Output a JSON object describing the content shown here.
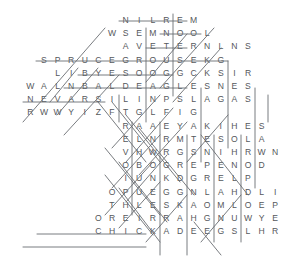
{
  "puzzle": {
    "title": "Word Search Grid",
    "rows": 17,
    "cols": 19,
    "cell_width": 13.6,
    "cell_height": 13.2,
    "origin_x": 10,
    "origin_y": 14,
    "letter_color": "#55585c",
    "mark_color": "#6a6d72",
    "background_color": "#ffffff",
    "grid": [
      "        N I L R E M      ",
      "       W S E M N O O L   ",
      "        A V E T E R N L N S ",
      "  S P R U C E G R O U S E K G ",
      "   L I B Y E S O O G G C K S I R ",
      " W A L N B A L D E A G L E S N E S ",
      " N E V A R S I L I N P S L A G A S ",
      " R       W W Y I Z F T G L F I G ",
      "        R A A E Y A K I H E S ",
      "        E L N R M T E S O L A ",
      "        V H W R G S N I H R W N ",
      "        O B O G R E P E N O D ",
      "        I U N K D G R E L P ",
      "       O P U E G G N L A H D L I ",
      "       T H L E S K A O M L O E P ",
      "      O R E I R R A H G N U W Y E ",
      "      C H I C K A D E E G S L H R "
    ],
    "rows_text": [
      {
        "row": 1,
        "letters": "N I L R E M",
        "start_col": 8
      },
      {
        "row": 2,
        "letters": "W S E M N O O L",
        "start_col": 7
      },
      {
        "row": 3,
        "letters": "A V E T E R N L N S",
        "start_col": 8
      },
      {
        "row": 4,
        "letters": "S P R U C E G R O U S E K G",
        "start_col": 2
      },
      {
        "row": 5,
        "letters": "L I B Y E S O O G G C K S I R",
        "start_col": 3
      },
      {
        "row": 6,
        "letters": "W A L N B A L D E A G L E S N E S",
        "start_col": 1
      },
      {
        "row": 7,
        "letters": "N E V A R S I L I N P S L A G A S",
        "start_col": 1
      },
      {
        "row": 8,
        "letters": "R W W Y I Z F T G L F I G",
        "start_col": 1
      },
      {
        "row": 9,
        "letters": "R A A E Y A K I H E S",
        "start_col": 8
      },
      {
        "row": 10,
        "letters": "E L N R M T E S O L A",
        "start_col": 8
      },
      {
        "row": 11,
        "letters": "V H W R G S N I H R W N",
        "start_col": 8
      },
      {
        "row": 12,
        "letters": "O B O G R E P E N O D",
        "start_col": 8
      },
      {
        "row": 13,
        "letters": "I U N K D G R E L P",
        "start_col": 8
      },
      {
        "row": 14,
        "letters": "O P U E G G N L A H D L I",
        "start_col": 7
      },
      {
        "row": 15,
        "letters": "T H L E S K A O M L O E P",
        "start_col": 7
      },
      {
        "row": 16,
        "letters": "O R E I R R A H G N U W Y E",
        "start_col": 6
      },
      {
        "row": 17,
        "letters": "C H I C K A D E E G S L H R",
        "start_col": 6
      }
    ],
    "found_word_marks": [
      {
        "name": "merlin-strike",
        "x1": 119,
        "y1": 21,
        "x2": 187,
        "y2": 21
      },
      {
        "name": "loons-strike",
        "x1": 160,
        "y1": 34,
        "x2": 201,
        "y2": 34
      },
      {
        "name": "tern-strike",
        "x1": 146,
        "y1": 48,
        "x2": 187,
        "y2": 48
      },
      {
        "name": "spruce-grouse-strike",
        "x1": 36,
        "y1": 61,
        "x2": 228,
        "y2": 61
      },
      {
        "name": "goose-strike",
        "x1": 78,
        "y1": 75,
        "x2": 173,
        "y2": 75
      },
      {
        "name": "bald-eagle-strike",
        "x1": 64,
        "y1": 88,
        "x2": 187,
        "y2": 88
      },
      {
        "name": "ravens-strike",
        "x1": 23,
        "y1": 102,
        "x2": 105,
        "y2": 102
      },
      {
        "name": "harrier-strike",
        "x1": 37,
        "y1": 234,
        "x2": 146,
        "y2": 234
      },
      {
        "name": "chickadee-strike",
        "x1": 23,
        "y1": 247,
        "x2": 146,
        "y2": 247
      },
      {
        "name": "vertical-strike-a",
        "x1": 146,
        "y1": 28,
        "x2": 146,
        "y2": 122
      },
      {
        "name": "vertical-strike-b",
        "x1": 173,
        "y1": 14,
        "x2": 173,
        "y2": 96
      },
      {
        "name": "vertical-strike-c",
        "x1": 201,
        "y1": 88,
        "x2": 201,
        "y2": 162
      },
      {
        "name": "vertical-strike-d",
        "x1": 228,
        "y1": 61,
        "x2": 228,
        "y2": 148
      },
      {
        "name": "vertical-strike-e",
        "x1": 255,
        "y1": 88,
        "x2": 255,
        "y2": 188
      },
      {
        "name": "vertical-strike-f",
        "x1": 160,
        "y1": 122,
        "x2": 160,
        "y2": 255
      },
      {
        "name": "vertical-strike-g",
        "x1": 187,
        "y1": 135,
        "x2": 187,
        "y2": 255
      },
      {
        "name": "vertical-strike-h",
        "x1": 214,
        "y1": 135,
        "x2": 214,
        "y2": 242
      },
      {
        "name": "vertical-strike-i",
        "x1": 241,
        "y1": 135,
        "x2": 241,
        "y2": 242
      },
      {
        "name": "vertical-strike-j",
        "x1": 132,
        "y1": 122,
        "x2": 132,
        "y2": 215
      },
      {
        "name": "vertical-strike-k",
        "x1": 119,
        "y1": 95,
        "x2": 119,
        "y2": 122
      },
      {
        "name": "vertical-strike-l",
        "x1": 268,
        "y1": 95,
        "x2": 268,
        "y2": 122
      },
      {
        "name": "diag-down-1",
        "x1": 105,
        "y1": 28,
        "x2": 23,
        "y2": 122
      },
      {
        "name": "diag-down-2",
        "x1": 78,
        "y1": 68,
        "x2": 50,
        "y2": 102
      },
      {
        "name": "diag-down-3",
        "x1": 98,
        "y1": 68,
        "x2": 57,
        "y2": 115
      },
      {
        "name": "diag-down-4",
        "x1": 119,
        "y1": 75,
        "x2": 64,
        "y2": 135
      },
      {
        "name": "diag-down-5",
        "x1": 98,
        "y1": 102,
        "x2": 146,
        "y2": 162
      },
      {
        "name": "diag-down-6",
        "x1": 112,
        "y1": 102,
        "x2": 160,
        "y2": 162
      },
      {
        "name": "diag-down-7",
        "x1": 126,
        "y1": 115,
        "x2": 180,
        "y2": 182
      },
      {
        "name": "diag-down-8",
        "x1": 139,
        "y1": 128,
        "x2": 194,
        "y2": 195
      },
      {
        "name": "diag-down-9",
        "x1": 105,
        "y1": 148,
        "x2": 160,
        "y2": 215
      },
      {
        "name": "diag-down-10",
        "x1": 119,
        "y1": 162,
        "x2": 167,
        "y2": 222
      },
      {
        "name": "diag-down-11",
        "x1": 105,
        "y1": 175,
        "x2": 153,
        "y2": 235
      },
      {
        "name": "diag-down-12",
        "x1": 119,
        "y1": 188,
        "x2": 160,
        "y2": 242
      },
      {
        "name": "diag-down-13",
        "x1": 201,
        "y1": 135,
        "x2": 248,
        "y2": 195
      },
      {
        "name": "diag-down-14",
        "x1": 194,
        "y1": 222,
        "x2": 221,
        "y2": 255
      },
      {
        "name": "diag-up-1",
        "x1": 160,
        "y1": 88,
        "x2": 214,
        "y2": 28
      },
      {
        "name": "diag-up-2",
        "x1": 173,
        "y1": 102,
        "x2": 221,
        "y2": 48
      },
      {
        "name": "diag-up-3",
        "x1": 146,
        "y1": 82,
        "x2": 187,
        "y2": 34
      },
      {
        "name": "diag-up-4",
        "x1": 112,
        "y1": 148,
        "x2": 160,
        "y2": 95
      },
      {
        "name": "diag-up-5",
        "x1": 126,
        "y1": 162,
        "x2": 173,
        "y2": 108
      },
      {
        "name": "diag-up-6",
        "x1": 139,
        "y1": 175,
        "x2": 187,
        "y2": 122
      },
      {
        "name": "diag-up-7",
        "x1": 112,
        "y1": 188,
        "x2": 160,
        "y2": 135
      },
      {
        "name": "diag-up-8",
        "x1": 126,
        "y1": 202,
        "x2": 167,
        "y2": 155
      },
      {
        "name": "diag-up-9",
        "x1": 105,
        "y1": 215,
        "x2": 153,
        "y2": 162
      },
      {
        "name": "diag-up-10",
        "x1": 119,
        "y1": 228,
        "x2": 160,
        "y2": 182
      },
      {
        "name": "diag-up-11",
        "x1": 187,
        "y1": 162,
        "x2": 228,
        "y2": 115
      },
      {
        "name": "diag-up-12",
        "x1": 201,
        "y1": 242,
        "x2": 241,
        "y2": 195
      },
      {
        "name": "diag-up-13",
        "x1": 146,
        "y1": 242,
        "x2": 187,
        "y2": 195
      }
    ]
  }
}
